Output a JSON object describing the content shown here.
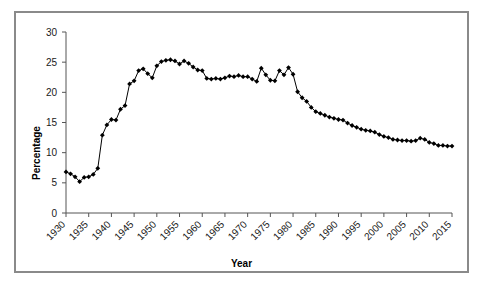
{
  "figure": {
    "background": "#ffffff",
    "frame_color": "#8a8a8a",
    "axis_color": "#555555",
    "series_color": "#000000",
    "marker_shape": "diamond"
  },
  "axis_titles": {
    "y": "Percentage",
    "x": "Year"
  },
  "chart_data": {
    "type": "line",
    "title": "",
    "xlabel": "Year",
    "ylabel": "Percentage",
    "xlim": [
      1930,
      2015
    ],
    "ylim": [
      0,
      30
    ],
    "xticks": [
      1930,
      1935,
      1940,
      1945,
      1950,
      1955,
      1960,
      1965,
      1970,
      1975,
      1980,
      1985,
      1990,
      1995,
      2000,
      2005,
      2010,
      2015
    ],
    "xtick_labels": [
      "1930",
      "1935",
      "1940",
      "1945",
      "1950",
      "1955",
      "1960",
      "1965",
      "1970",
      "1975",
      "1980",
      "1985",
      "1990",
      "1995",
      "2000",
      "2005",
      "2010",
      "2015"
    ],
    "yticks": [
      0,
      5,
      10,
      15,
      20,
      25,
      30
    ],
    "ytick_labels": [
      "0",
      "5",
      "10",
      "15",
      "20",
      "25",
      "30"
    ],
    "grid": false,
    "legend": false,
    "marker": "diamond",
    "line_color": "#000000",
    "x": [
      1930,
      1931,
      1932,
      1933,
      1934,
      1935,
      1936,
      1937,
      1938,
      1939,
      1940,
      1941,
      1942,
      1943,
      1944,
      1945,
      1946,
      1947,
      1948,
      1949,
      1950,
      1951,
      1952,
      1953,
      1954,
      1955,
      1956,
      1957,
      1958,
      1959,
      1960,
      1961,
      1962,
      1963,
      1964,
      1965,
      1966,
      1967,
      1968,
      1969,
      1970,
      1971,
      1972,
      1973,
      1974,
      1975,
      1976,
      1977,
      1978,
      1979,
      1980,
      1981,
      1982,
      1983,
      1984,
      1985,
      1986,
      1987,
      1988,
      1989,
      1990,
      1991,
      1992,
      1993,
      1994,
      1995,
      1996,
      1997,
      1998,
      1999,
      2000,
      2001,
      2002,
      2003,
      2004,
      2005,
      2006,
      2007,
      2008,
      2009,
      2010,
      2011,
      2012,
      2013,
      2014,
      2015
    ],
    "y": [
      6.8,
      6.5,
      6.0,
      5.2,
      5.9,
      6.0,
      6.4,
      7.4,
      12.9,
      14.6,
      15.5,
      15.4,
      17.2,
      17.8,
      21.4,
      21.9,
      23.6,
      23.9,
      23.1,
      22.4,
      24.4,
      25.1,
      25.3,
      25.4,
      25.2,
      24.7,
      25.2,
      24.8,
      24.2,
      23.7,
      23.6,
      22.3,
      22.2,
      22.3,
      22.2,
      22.4,
      22.7,
      22.6,
      22.8,
      22.6,
      22.6,
      22.2,
      21.8,
      24.0,
      22.9,
      22.0,
      21.9,
      23.6,
      22.9,
      24.1,
      23.0,
      20.1,
      19.1,
      18.5,
      17.5,
      16.8,
      16.5,
      16.2,
      15.9,
      15.7,
      15.5,
      15.4,
      14.9,
      14.5,
      14.2,
      13.9,
      13.7,
      13.6,
      13.4,
      13.0,
      12.7,
      12.5,
      12.2,
      12.1,
      12.0,
      12.0,
      11.9,
      12.0,
      12.4,
      12.2,
      11.7,
      11.5,
      11.2,
      11.2,
      11.1,
      11.1
    ]
  }
}
